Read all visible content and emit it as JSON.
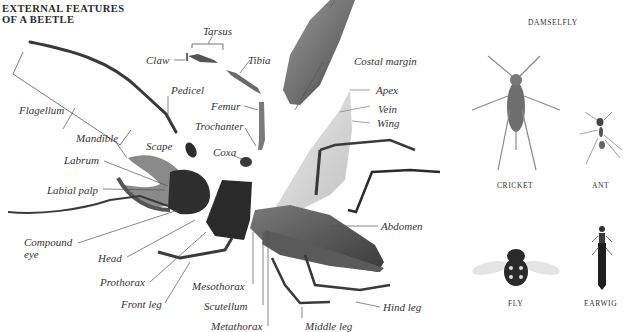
{
  "title": {
    "line1": "EXTERNAL FEATURES",
    "line2": "OF A BEETLE"
  },
  "beetle_labels": {
    "tarsus": "Tarsus",
    "claw": "Claw",
    "tibia": "Tibia",
    "pedicel": "Pedicel",
    "flagellum": "Flagellum",
    "femur": "Femur",
    "trochanter": "Trochanter",
    "mandible": "Mandible",
    "scape": "Scape",
    "coxa": "Coxa",
    "labrum": "Labrum",
    "labial_palp": "Labial palp",
    "compound_eye_1": "Compound",
    "compound_eye_2": "eye",
    "head": "Head",
    "prothorax": "Prothorax",
    "front_leg": "Front leg",
    "mesothorax": "Mesothorax",
    "scutellum": "Scutellum",
    "metathorax": "Metathorax",
    "middle_leg": "Middle leg",
    "hind_leg": "Hind leg",
    "abdomen": "Abdomen",
    "costal_margin": "Costal margin",
    "apex": "Apex",
    "vein": "Vein",
    "wing": "Wing"
  },
  "other_insects": [
    {
      "name": "DAMSELFLY"
    },
    {
      "name": "CRICKET"
    },
    {
      "name": "ANT"
    },
    {
      "name": "FLY"
    },
    {
      "name": "EARWIG"
    }
  ],
  "colors": {
    "text": "#333333",
    "insect_dark": "#2b2b2b",
    "insect_mid": "#6b6b6b",
    "wing_light": "#d9d9d9",
    "leader_line": "#555555"
  }
}
